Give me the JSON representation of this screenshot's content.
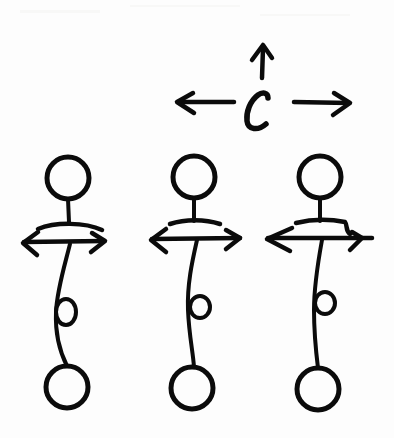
{
  "diagram": {
    "ink_color": "#0b0b0b",
    "background_color": "#fdfdfd",
    "top_symbol": {
      "label": "C",
      "arrows": [
        "left",
        "up",
        "right"
      ]
    },
    "figures": [
      {
        "id": "figure-left",
        "head": "circle",
        "tail": "circle",
        "has_loop": true,
        "arrow": "double-horizontal"
      },
      {
        "id": "figure-middle",
        "head": "circle",
        "tail": "circle",
        "has_loop": true,
        "arrow": "double-horizontal"
      },
      {
        "id": "figure-right",
        "head": "circle",
        "tail": "circle",
        "has_loop": true,
        "arrow": "double-horizontal"
      }
    ]
  }
}
